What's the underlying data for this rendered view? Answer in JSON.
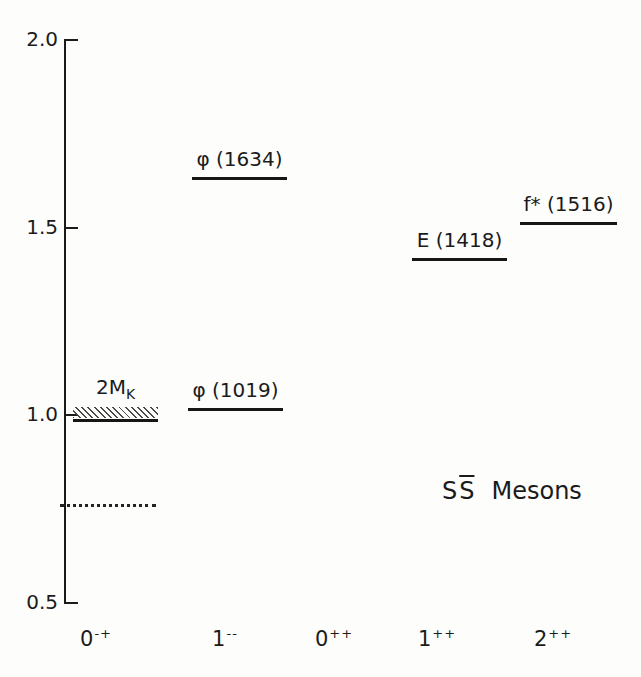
{
  "colors": {
    "ink": "#1b1b1b",
    "background": "#fdfdfc"
  },
  "chart_data": {
    "type": "line",
    "subtype": "energy-level-diagram",
    "xlabel": "",
    "ylabel": "",
    "ylim": [
      0.5,
      2.0
    ],
    "grid": false,
    "yticks": [
      {
        "value": 2.0,
        "label": "2.0"
      },
      {
        "value": 1.5,
        "label": "1.5"
      },
      {
        "value": 1.0,
        "label": "1.0"
      },
      {
        "value": 0.5,
        "label": "0.5"
      }
    ],
    "categories": [
      {
        "base": "0",
        "sup": "-+"
      },
      {
        "base": "1",
        "sup": "--"
      },
      {
        "base": "0",
        "sup": "++"
      },
      {
        "base": "1",
        "sup": "++"
      },
      {
        "base": "2",
        "sup": "++"
      }
    ],
    "levels": [
      {
        "label": "φ (1634)",
        "mass_gev": 1.634,
        "jpc": "1--"
      },
      {
        "label": "φ (1019)",
        "mass_gev": 1.019,
        "jpc": "1--"
      },
      {
        "label": "E (1418)",
        "mass_gev": 1.418,
        "jpc": "1++"
      },
      {
        "label": "f* (1516)",
        "mass_gev": 1.516,
        "jpc": "2++"
      }
    ],
    "threshold": {
      "label_main": "2M",
      "label_sub": "K",
      "mass_gev": 0.99,
      "jpc": "0-+",
      "style": "hatched-band"
    },
    "dotted_level": {
      "mass_gev": 0.76,
      "jpc": "0-+",
      "style": "dotted"
    },
    "annotation": {
      "s": "S",
      "sbar": "S",
      "text": "Mesons"
    }
  }
}
